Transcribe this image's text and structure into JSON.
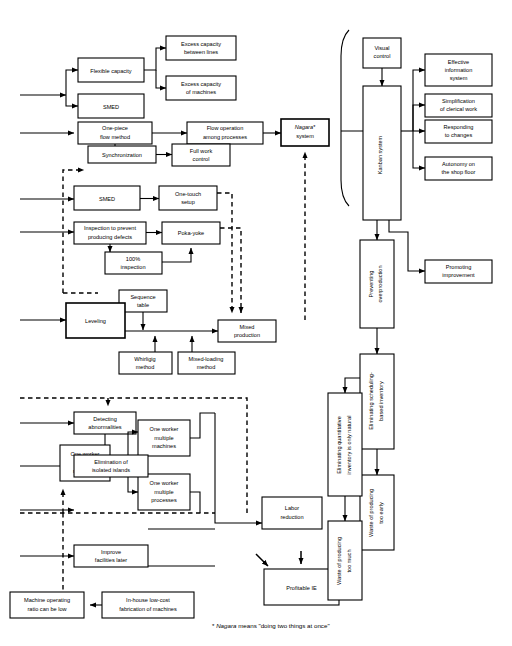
{
  "figure": {
    "title": "",
    "footnote_prefix": "*",
    "footnote": "Nagara means \"doing two things at once\"",
    "footnote_italic_word": "Nagara",
    "colors": {
      "stroke": "#000000",
      "fill": "#ffffff",
      "background": "#ffffff"
    }
  },
  "boxes": {
    "flexible_capacity": "Flexible capacity",
    "excess_capacity_between_lines_l1": "Excess capacity",
    "excess_capacity_between_lines_l2": "between lines",
    "excess_capacity_of_machines_l1": "Excess capacity",
    "excess_capacity_of_machines_l2": "of machines",
    "smed_top": "SMED",
    "one_piece_flow_l1": "One-piece",
    "one_piece_flow_l2": "flow method",
    "flow_operation_l1": "Flow operation",
    "flow_operation_l2": "among processes",
    "nagara_l1": "Nagara*",
    "nagara_l2": "system",
    "synchronization": "Synchronization",
    "full_work_control_l1": "Full work",
    "full_work_control_l2": "control",
    "smed_mid": "SMED",
    "one_touch_setup_l1": "One-touch",
    "one_touch_setup_l2": "setup",
    "inspection_prevent_l1": "Inspection to prevent",
    "inspection_prevent_l2": "producing defects",
    "poka_yoke": "Poka-yoke",
    "hundred_pct_inspection_l1": "100%",
    "hundred_pct_inspection_l2": "inspection",
    "sequence_table_l1": "Sequence",
    "sequence_table_l2": "table",
    "leveling": "Leveling",
    "mixed_production_l1": "Mixed",
    "mixed_production_l2": "production",
    "whirligig_method_l1": "Whirligig",
    "whirligig_method_l2": "method",
    "mixed_loading_method_l1": "Mixed-loading",
    "mixed_loading_method_l2": "method",
    "detecting_abnormalities_l1": "Detecting",
    "detecting_abnormalities_l2": "abnormalities",
    "one_worker_multi_machines_a_l1": "One worker",
    "one_worker_multi_machines_a_l2": "multiple",
    "one_worker_multi_machines_a_l3": "machines",
    "one_worker_multi_machines_b_l1": "One worker",
    "one_worker_multi_machines_b_l2": "multiple",
    "one_worker_multi_machines_b_l3": "machines",
    "one_worker_multi_processes_l1": "One worker",
    "one_worker_multi_processes_l2": "multiple",
    "one_worker_multi_processes_l3": "processes",
    "labor_reduction_l1": "Labor",
    "labor_reduction_l2": "reduction",
    "elimination_isolated_islands_l1": "Elimination of",
    "elimination_isolated_islands_l2": "isolated islands",
    "improve_facilities_later_l1": "Improve",
    "improve_facilities_later_l2": "facilities later",
    "machine_operating_ratio_l1": "Machine operating",
    "machine_operating_ratio_l2": "ratio can be low",
    "in_house_fabrication_l1": "In-house low-cost",
    "in_house_fabrication_l2": "fabrication of machines",
    "profitable_ie": "Profitable IE",
    "visual_control_l1": "Visual",
    "visual_control_l2": "control",
    "kanban_system": "Kanban system",
    "effective_info_system_l1": "Effective",
    "effective_info_system_l2": "information",
    "effective_info_system_l3": "system",
    "simplification_clerical_l1": "Simplification",
    "simplification_clerical_l2": "of clerical work",
    "responding_changes_l1": "Responding",
    "responding_changes_l2": "to changes",
    "autonomy_shop_floor_l1": "Autonomy on",
    "autonomy_shop_floor_l2": "the shop floor",
    "promoting_improvement_l1": "Promoting",
    "promoting_improvement_l2": "improvement",
    "preventing_overproduction_l1": "Preventing",
    "preventing_overproduction_l2": "overproduction",
    "eliminating_scheduling_l1": "Eliminating scheduling-",
    "eliminating_scheduling_l2": "based inventory",
    "eliminating_quantitative_l1": "Eliminating quantitative",
    "eliminating_quantitative_l2": "inventory is only natural",
    "waste_producing_too_early_l1": "Waste of producing",
    "waste_producing_too_early_l2": "too early",
    "waste_producing_too_much_l1": "Waste of producing",
    "waste_producing_too_much_l2": "too much"
  }
}
